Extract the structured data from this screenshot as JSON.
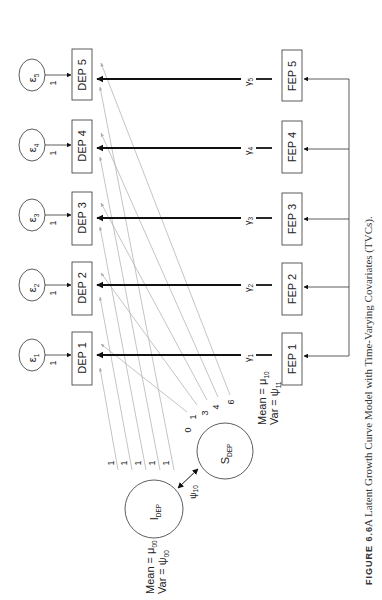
{
  "figure": {
    "caption_label": "FIGURE 6.6",
    "caption_text": "A Latent Growth Curve Model with Time-Varying Covariates (TVCs)."
  },
  "diagram": {
    "residuals": [
      {
        "symbol": "ε",
        "sub": "1",
        "loading": "1"
      },
      {
        "symbol": "ε",
        "sub": "2",
        "loading": "1"
      },
      {
        "symbol": "ε",
        "sub": "3",
        "loading": "1"
      },
      {
        "symbol": "ε",
        "sub": "4",
        "loading": "1"
      },
      {
        "symbol": "ε",
        "sub": "5",
        "loading": "1"
      }
    ],
    "dep_boxes": [
      "DEP 1",
      "DEP 2",
      "DEP 3",
      "DEP 4",
      "DEP 5"
    ],
    "fep_boxes": [
      "FEP 1",
      "FEP 2",
      "FEP 3",
      "FEP 4",
      "FEP 5"
    ],
    "gammas": [
      {
        "symbol": "γ",
        "sub": "1"
      },
      {
        "symbol": "γ",
        "sub": "2"
      },
      {
        "symbol": "γ",
        "sub": "3"
      },
      {
        "symbol": "γ",
        "sub": "4"
      },
      {
        "symbol": "γ",
        "sub": "5"
      }
    ],
    "intercept": {
      "symbol": "I",
      "sub": "DEP",
      "mean_label": "Mean = μ",
      "mean_sub": "00",
      "var_label": "Var = ψ",
      "var_sub": "00",
      "loadings": [
        "1",
        "1",
        "1",
        "1",
        "1"
      ]
    },
    "slope": {
      "symbol": "S",
      "sub": "DEP",
      "mean_label": "Mean = μ",
      "mean_sub": "10",
      "var_label": "Var = ψ",
      "var_sub": "11",
      "loadings": [
        "0",
        "1",
        "3",
        "4",
        "6"
      ]
    },
    "covariance": {
      "symbol": "ψ",
      "sub": "10"
    }
  }
}
